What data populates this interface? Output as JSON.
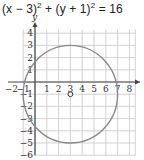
{
  "equation": {
    "part1": "(x − 3)",
    "exp1": "2",
    "plus": " + (y + 1)",
    "exp2": "2",
    "rhs": " = 16"
  },
  "chart_data": {
    "type": "scatter",
    "xlabel": "x",
    "ylabel": "y",
    "xlim": [
      -1,
      8.5
    ],
    "ylim": [
      -6,
      4.3
    ],
    "grid": true,
    "x_ticks": [
      "−2",
      "−1",
      "1",
      "2",
      "3",
      "4",
      "5",
      "6",
      "7",
      "8"
    ],
    "y_ticks": [
      "4",
      "3",
      "2",
      "1",
      "1",
      "2",
      "3",
      "4",
      "5",
      "6"
    ],
    "circle": {
      "center": [
        3,
        -1
      ],
      "radius": 4
    },
    "points": [
      {
        "x": 3,
        "y": -1,
        "style": "open-circle",
        "label": "center"
      }
    ],
    "colors": {
      "curve": "#8a8a8a",
      "grid": "#c8c8c8",
      "axes": "#444444"
    }
  },
  "labels": {
    "x_axis": "x",
    "y_axis": "y",
    "xticks": [
      {
        "v": -2,
        "t": "−2"
      },
      {
        "v": -1,
        "t": "−1"
      },
      {
        "v": 1,
        "t": "1"
      },
      {
        "v": 2,
        "t": "2"
      },
      {
        "v": 3,
        "t": "3"
      },
      {
        "v": 4,
        "t": "4"
      },
      {
        "v": 5,
        "t": "5"
      },
      {
        "v": 6,
        "t": "6"
      },
      {
        "v": 7,
        "t": "7"
      },
      {
        "v": 8,
        "t": "8"
      }
    ],
    "yticks": [
      {
        "v": 4,
        "t": "4"
      },
      {
        "v": 3,
        "t": "3"
      },
      {
        "v": 2,
        "t": "2"
      },
      {
        "v": 1,
        "t": "1"
      },
      {
        "v": -1,
        "t": "1"
      },
      {
        "v": -2,
        "t": "2"
      },
      {
        "v": -3,
        "t": "3"
      },
      {
        "v": -4,
        "t": "4"
      },
      {
        "v": -5,
        "t": "5"
      },
      {
        "v": -6,
        "t": "6"
      }
    ]
  }
}
